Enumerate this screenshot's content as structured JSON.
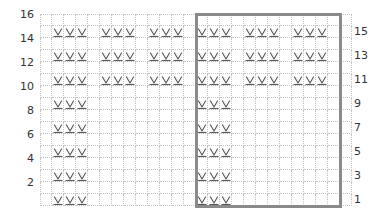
{
  "chart": {
    "type": "knitting-chart",
    "columns": 26,
    "rows": 16,
    "cell_size_px": 12,
    "colors": {
      "grid_line": "#c4c4c4",
      "repeat_box": "#8a8a8a",
      "symbol": "#555555",
      "label": "#333333"
    },
    "left_labels": [
      "16",
      "14",
      "12",
      "10",
      "8",
      "6",
      "4",
      "2"
    ],
    "right_labels": [
      "15",
      "13",
      "11",
      "9",
      "7",
      "5",
      "3",
      "1"
    ],
    "symbol": {
      "name": "slip-stitch-wyif-icon",
      "glyph": "V with underline"
    },
    "repeat_box": {
      "start_col": 14,
      "end_col": 25,
      "start_row": 1,
      "end_row": 16
    },
    "stitch_rows": [
      {
        "row": 15,
        "cols": [
          2,
          3,
          4,
          6,
          7,
          8,
          10,
          11,
          12,
          14,
          15,
          16,
          18,
          19,
          20,
          22,
          23,
          24
        ]
      },
      {
        "row": 13,
        "cols": [
          2,
          3,
          4,
          6,
          7,
          8,
          10,
          11,
          12,
          14,
          15,
          16,
          18,
          19,
          20,
          22,
          23,
          24
        ]
      },
      {
        "row": 11,
        "cols": [
          2,
          3,
          4,
          6,
          7,
          8,
          10,
          11,
          12,
          14,
          15,
          16,
          18,
          19,
          20,
          22,
          23,
          24
        ]
      },
      {
        "row": 9,
        "cols": [
          2,
          3,
          4,
          14,
          15,
          16
        ]
      },
      {
        "row": 7,
        "cols": [
          2,
          3,
          4,
          14,
          15,
          16
        ]
      },
      {
        "row": 5,
        "cols": [
          2,
          3,
          4,
          14,
          15,
          16
        ]
      },
      {
        "row": 3,
        "cols": [
          2,
          3,
          4,
          14,
          15,
          16
        ]
      },
      {
        "row": 1,
        "cols": [
          2,
          3,
          4,
          14,
          15,
          16
        ]
      }
    ]
  }
}
